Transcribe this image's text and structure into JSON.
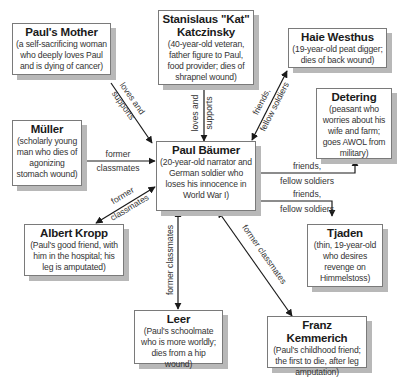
{
  "diagram": {
    "type": "character-relationship-map",
    "center": {
      "name": "Paul Bäumer",
      "description": "(20-year-old narrator and German soldier who loses his innocence in World War I)"
    },
    "nodes": {
      "mother": {
        "name": "Paul's Mother",
        "description": "(a self-sacrificing woman who deeply loves Paul and is dying of cancer)"
      },
      "kat": {
        "name": "Stanislaus \"Kat\" Katczinsky",
        "description": "(40-year-old veteran, father figure to Paul, food provider; dies of shrapnel wound)"
      },
      "haie": {
        "name": "Haie Westhus",
        "description": "(19-year-old peat digger; dies of back wound)"
      },
      "detering": {
        "name": "Detering",
        "description": "(peasant who worries about his wife and farm; goes AWOL from military)"
      },
      "muller": {
        "name": "Müller",
        "description": "(scholarly young man who dies of agonizing stomach wound)"
      },
      "kropp": {
        "name": "Albert Kropp",
        "description": "(Paul's good friend, with him in the hospital; his leg is amputated)"
      },
      "tjaden": {
        "name": "Tjaden",
        "description": "(thin, 19-year-old who desires revenge on Himmelstoss)"
      },
      "leer": {
        "name": "Leer",
        "description": "(Paul's schoolmate who is more worldly; dies from a hip wound)"
      },
      "kemmerich": {
        "name": "Franz Kemmerich",
        "description": "(Paul's childhood friend; the first to die, after leg amputation)"
      }
    },
    "edges": {
      "mother": {
        "label_1": "loves and",
        "label_2": "supports"
      },
      "kat": {
        "label_1": "loves and",
        "label_2": "supports"
      },
      "haie": {
        "label_1": "friends,",
        "label_2": "fellow soldiers"
      },
      "detering": {
        "label_1": "friends,",
        "label_2": "fellow soldiers"
      },
      "tjaden": {
        "label_1": "friends,",
        "label_2": "fellow soldiers"
      },
      "muller": {
        "label_1": "former",
        "label_2": "classmates"
      },
      "kropp": {
        "label_1": "former",
        "label_2": "classmates"
      },
      "leer": {
        "label_1": "former classmates"
      },
      "kemmerich": {
        "label_1": "former classmates"
      }
    }
  }
}
